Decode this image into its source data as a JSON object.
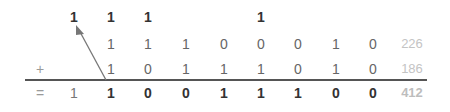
{
  "diagram": {
    "carries": [
      {
        "col": 0,
        "value": "1"
      },
      {
        "col": 1,
        "value": "1"
      },
      {
        "col": 2,
        "value": "1"
      },
      {
        "col": 5,
        "value": "1"
      }
    ],
    "operand1": {
      "bits": [
        "",
        "1",
        "1",
        "1",
        "0",
        "0",
        "0",
        "1",
        "0"
      ],
      "decimal": "226"
    },
    "operand2": {
      "sign": "+",
      "bits": [
        "",
        "1",
        "0",
        "1",
        "1",
        "1",
        "0",
        "1",
        "0"
      ],
      "decimal": "186"
    },
    "result": {
      "sign": "=",
      "bits": [
        "1",
        "1",
        "0",
        "0",
        "1",
        "1",
        "1",
        "0",
        "0"
      ],
      "decimal": "412"
    },
    "arrow": {
      "description": "carry-out arrow from result column 1 up to carry in column 0",
      "color": "#777777"
    },
    "colors": {
      "carry": "#333333",
      "operand": "#666666",
      "result": "#333333",
      "decimal": "#c4c4c4",
      "sign": "#9a9a9a",
      "line": "#555555"
    }
  }
}
